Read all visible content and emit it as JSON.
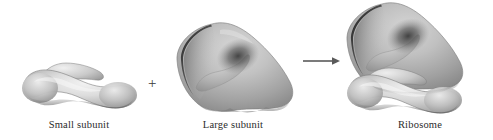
{
  "figure": {
    "title_alt": "Ribosome assembly from small and large subunits",
    "operator_plus": "+",
    "arrow_icon": "right-arrow-icon",
    "background_color": "#ffffff",
    "labels": {
      "small_subunit": "Small subunit",
      "large_subunit": "Large subunit",
      "ribosome": "Ribosome"
    },
    "shapes": [
      {
        "name": "small-subunit",
        "label": "Small subunit",
        "fill_light": "#e8e8e8",
        "fill_mid": "#b4b4b4",
        "fill_dark": "#6e6e6e",
        "bbox": [
          22,
          62,
          113,
          46
        ]
      },
      {
        "name": "large-subunit",
        "label": "Large subunit",
        "fill_light": "#c9c9c9",
        "fill_mid": "#9a9a9a",
        "fill_dark": "#4a4a4a",
        "bbox": [
          175,
          22,
          118,
          90
        ]
      },
      {
        "name": "ribosome-complex",
        "label": "Ribosome",
        "fill_light": "#dedede",
        "fill_mid": "#9c9c9c",
        "fill_dark": "#4a4a4a",
        "bbox": [
          345,
          2,
          143,
          110
        ]
      }
    ],
    "arrow": {
      "x_start": 303,
      "x_end": 338,
      "y": 61,
      "color": "#5a5a5a"
    }
  }
}
